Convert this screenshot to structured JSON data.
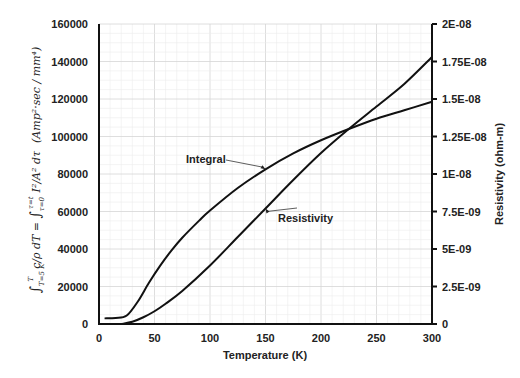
{
  "chart_data": {
    "type": "line",
    "title": "",
    "xlabel": "Temperature (K)",
    "ylabel_left": "∫_{T=5K}^{T} (c/ρ) dT = ∫_{τ=0}^{τ=t} (I²/A²) dτ   (Amp²·sec / mm⁴)",
    "ylabel_left_parts": {
      "lhs": "∫ T=5 K → T  c/ρ dT",
      "rhs": "= ∫ τ=0 → τ=t  I²/A² dτ",
      "units": "(Amp²·sec / mm⁴)"
    },
    "ylabel_right": "Resistivity (ohm-m)",
    "xlim": [
      0,
      300
    ],
    "ylim_left": [
      0,
      160000
    ],
    "ylim_right": [
      0,
      2e-08
    ],
    "x_ticks": [
      "0",
      "50",
      "100",
      "150",
      "200",
      "250",
      "300"
    ],
    "x_tick_values": [
      0,
      50,
      100,
      150,
      200,
      250,
      300
    ],
    "y_left_ticks": [
      "0",
      "20000",
      "40000",
      "60000",
      "80000",
      "100000",
      "120000",
      "140000",
      "160000"
    ],
    "y_left_tick_values": [
      0,
      20000,
      40000,
      60000,
      80000,
      100000,
      120000,
      140000,
      160000
    ],
    "y_right_ticks": [
      "0",
      "2.5E-09",
      "5E-09",
      "7.5E-09",
      "1E-08",
      "1.25E-08",
      "1.5E-08",
      "1.75E-08",
      "2E-08"
    ],
    "y_right_tick_values": [
      0,
      2.5e-09,
      5e-09,
      7.5e-09,
      1e-08,
      1.25e-08,
      1.5e-08,
      1.75e-08,
      2e-08
    ],
    "grid": true,
    "legend": "none (inline annotations)",
    "series": [
      {
        "name": "Integral",
        "axis": "left",
        "x": [
          5,
          15,
          25,
          35,
          45,
          55,
          65,
          75,
          90,
          100,
          125,
          150,
          175,
          200,
          225,
          250,
          275,
          300
        ],
        "values": [
          3000,
          3200,
          4500,
          12000,
          22000,
          31000,
          39000,
          46000,
          55000,
          60500,
          72500,
          82500,
          91000,
          98000,
          104000,
          109500,
          114000,
          118500
        ]
      },
      {
        "name": "Resistivity",
        "axis": "right",
        "x": [
          20,
          30,
          40,
          50,
          60,
          75,
          100,
          125,
          150,
          175,
          200,
          225,
          250,
          275,
          300
        ],
        "values": [
          0,
          1.5e-10,
          4.5e-10,
          8.5e-10,
          1.35e-09,
          2.2e-09,
          3.9e-09,
          5.8e-09,
          7.7e-09,
          9.6e-09,
          1.14e-08,
          1.3e-08,
          1.45e-08,
          1.6e-08,
          1.78e-08
        ]
      }
    ],
    "annotations": [
      {
        "text": "Integral",
        "points_to_series": "Integral",
        "at_x": 150
      },
      {
        "text": "Resistivity",
        "points_to_series": "Resistivity",
        "at_x": 150
      }
    ]
  }
}
